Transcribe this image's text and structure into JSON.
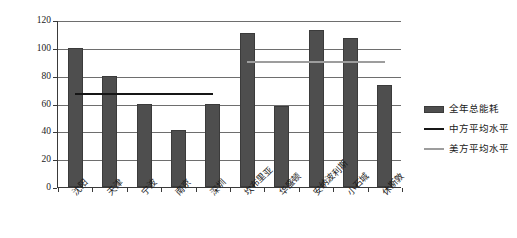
{
  "chart_data": {
    "type": "bar",
    "title": "",
    "xlabel": "",
    "ylabel": "kWh/m²",
    "ylabel_base": "kWh/m",
    "ylabel_sup": "2",
    "ylim": [
      0,
      120
    ],
    "ytick_values": [
      0,
      20,
      40,
      60,
      80,
      100,
      120
    ],
    "ytick_labels": [
      "0",
      "20",
      "40",
      "60",
      "80",
      "100",
      "120"
    ],
    "grid": "horizontal",
    "legend_position": "right",
    "categories": [
      "沈阳",
      "天津",
      "宁波",
      "南京",
      "深圳",
      "坎布里亚",
      "华盛顿",
      "安纳波利斯",
      "小石城",
      "休斯敦"
    ],
    "series": [
      {
        "name": "全年总能耗",
        "type": "bar",
        "color": "#4e4e4e",
        "values": [
          100,
          80,
          59.5,
          41,
          59.5,
          111,
          58.5,
          113,
          107,
          73
        ]
      },
      {
        "name": "中方平均水平",
        "type": "line",
        "color": "#161616",
        "value": 68,
        "spans_categories": [
          0,
          4
        ]
      },
      {
        "name": "美方平均水平",
        "type": "line",
        "color": "#9d9d9d",
        "value": 91.5,
        "spans_categories": [
          5,
          9
        ]
      }
    ],
    "legend": [
      {
        "label": "全年总能耗",
        "key": "swatch",
        "color": "#4e4e4e"
      },
      {
        "label": "中方平均水平",
        "key": "line",
        "color": "#161616"
      },
      {
        "label": "美方平均水平",
        "key": "line",
        "color": "#9d9d9d"
      }
    ]
  }
}
